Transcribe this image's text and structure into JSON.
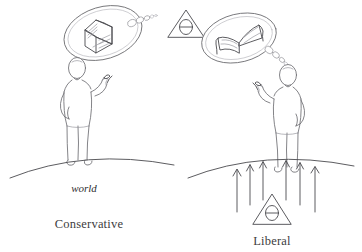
{
  "figure": {
    "background_color": "#ffffff",
    "ink_color": "#6e6e72",
    "text_color": "#3c3c40",
    "width": 362,
    "height": 252
  },
  "panels": [
    {
      "id": "conservative",
      "caption": "Conservative",
      "ground_label": "world",
      "thought_bubble": {
        "icon": "closed-book-icon",
        "description": "closed book"
      },
      "theta_badge": {
        "symbol": "θ",
        "shape": "triangle",
        "position": "outside-above"
      },
      "arrows": {
        "count": 0,
        "direction": "none"
      }
    },
    {
      "id": "liberal",
      "caption": "Liberal",
      "ground_label": "",
      "thought_bubble": {
        "icon": "open-book-icon",
        "description": "open book"
      },
      "theta_badge": {
        "symbol": "θ",
        "shape": "triangle",
        "position": "below-ground"
      },
      "arrows": {
        "count": 6,
        "direction": "up"
      }
    }
  ],
  "labels": {
    "conservative_caption": "Conservative",
    "liberal_caption": "Liberal",
    "world_label": "world",
    "theta_symbol": "θ"
  }
}
